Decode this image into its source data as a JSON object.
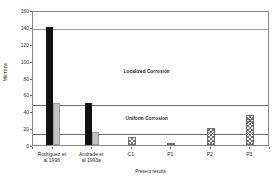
{
  "chart_data": {
    "type": "bar",
    "title": "",
    "xlabel": "Present results",
    "ylabel": "Microns",
    "ylim": [
      0,
      160
    ],
    "ytick_values": [
      0,
      20,
      40,
      60,
      80,
      100,
      120,
      140,
      160
    ],
    "ytick_labels": [
      "0",
      "20",
      "40",
      "60",
      "80",
      "100",
      "120",
      "140",
      "160"
    ],
    "grid": true,
    "gridlines_y": [
      50,
      140
    ],
    "legend_position": "none",
    "categories": [
      "Rodriguez et al 1996",
      "Andrade et al 1993a",
      "C1",
      "P1",
      "P2",
      "P3"
    ],
    "category_lines": [
      [
        "Rodriguez et",
        "al 1996"
      ],
      [
        "Andrade et",
        "al 1993a"
      ],
      [
        "C1"
      ],
      [
        "P1"
      ],
      [
        "P2"
      ],
      [
        "P3"
      ]
    ],
    "series": [
      {
        "name": "Localized corrosion (maximum pit depth)",
        "fill": "solid-black",
        "color": "#111111",
        "values": [
          140,
          50,
          null,
          null,
          null,
          null
        ]
      },
      {
        "name": "Uniform corrosion",
        "fill": "solid-gray",
        "color": "#c2c2c2",
        "values": [
          50,
          15,
          null,
          null,
          null,
          null
        ]
      },
      {
        "name": "Present results",
        "fill": "crosshatch",
        "color": "#6d6d6d",
        "values": [
          null,
          null,
          10,
          2,
          20,
          35
        ]
      }
    ],
    "annotations": [
      {
        "text": "Localized Corrosion",
        "x_frac": 0.48,
        "y_value": 90
      },
      {
        "text": "Uniform Corrosion",
        "x_frac": 0.48,
        "y_value": 34
      }
    ],
    "threshold_lines": [
      {
        "value": 50,
        "label": "localized/uniform boundary"
      },
      {
        "value": 15,
        "label": "uniform corrosion limit"
      }
    ]
  }
}
